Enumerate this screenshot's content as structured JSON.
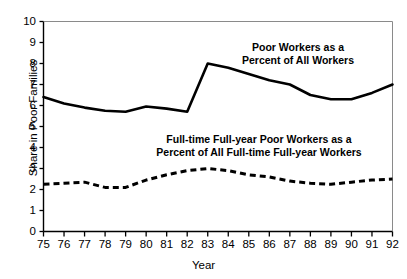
{
  "chart_data": {
    "type": "line",
    "title": "",
    "xlabel": "Year",
    "ylabel": "Share in Poor Families",
    "xlim": [
      75,
      92
    ],
    "ylim": [
      0,
      10
    ],
    "grid": false,
    "legend_position": "inline-annotations",
    "x": [
      75,
      76,
      77,
      78,
      79,
      80,
      81,
      82,
      83,
      84,
      85,
      86,
      87,
      88,
      89,
      90,
      91,
      92
    ],
    "xtick_labels": [
      "75",
      "76",
      "77",
      "78",
      "79",
      "80",
      "81",
      "82",
      "83",
      "84",
      "85",
      "86",
      "87",
      "88",
      "89",
      "90",
      "91",
      "92"
    ],
    "ytick_labels": [
      "0",
      "1",
      "2",
      "3",
      "4",
      "5",
      "6",
      "7",
      "8",
      "9",
      "10"
    ],
    "series": [
      {
        "name": "Poor Workers as a Percent of All Workers",
        "style": "solid",
        "color": "#000000",
        "values": [
          6.4,
          6.1,
          5.9,
          5.75,
          5.7,
          5.95,
          5.85,
          5.7,
          8.0,
          7.8,
          7.5,
          7.2,
          7.0,
          6.5,
          6.3,
          6.3,
          6.6,
          7.0
        ]
      },
      {
        "name": "Full-time Full-year Poor Workers as a Percent of All Full-time Full-year Workers",
        "style": "dashed",
        "color": "#000000",
        "values": [
          2.25,
          2.3,
          2.35,
          2.1,
          2.1,
          2.45,
          2.7,
          2.9,
          3.0,
          2.9,
          2.7,
          2.6,
          2.4,
          2.3,
          2.25,
          2.35,
          2.45,
          2.5
        ]
      }
    ],
    "annotations": [
      {
        "id": "anno-solid",
        "line1": "Poor Workers as a",
        "line2": "Percent of All Workers"
      },
      {
        "id": "anno-dash",
        "line1": "Full-time Full-year Poor Workers as a",
        "line2": "Percent of All Full-time Full-year Workers"
      }
    ]
  },
  "axes": {
    "y_title": "Share in Poor Families",
    "x_title": "Year"
  },
  "colors": {
    "axis": "#000000",
    "line": "#000000",
    "background": "#ffffff"
  }
}
